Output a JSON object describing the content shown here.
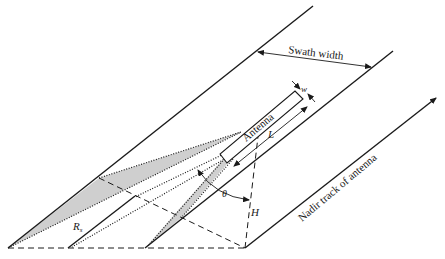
{
  "diagram": {
    "type": "side-looking radar imaging geometry",
    "labels": {
      "swath_width": "Swath width",
      "antenna": "Antenna",
      "width_symbol": "w",
      "length_symbol": "L",
      "look_angle_symbol": "θ",
      "height_symbol": "H",
      "slant_range_symbol": "R",
      "slant_range_subscript": "s",
      "nadir_track": "Nadir track of antenna"
    },
    "colors": {
      "line": "#1a1a1a",
      "beam_fill": "#cfcfcf",
      "background": "#ffffff"
    }
  }
}
